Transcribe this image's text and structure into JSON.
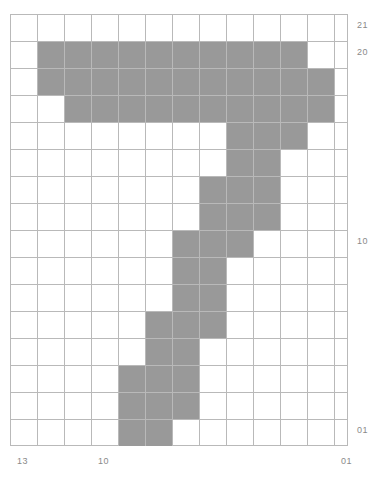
{
  "figure": {
    "kind": "grid-heatmap",
    "background_color": "#ffffff",
    "grid_line_color": "#b9b9b9",
    "filled_cell_color": "#999999"
  },
  "axes": {
    "y_ticks": [
      {
        "label": "21",
        "row_index": 0
      },
      {
        "label": "20",
        "row_index": 1
      },
      {
        "label": "10",
        "row_index": 8
      },
      {
        "label": "01",
        "row_index": 15
      }
    ],
    "x_ticks": [
      {
        "label": "13",
        "col_index": 0
      },
      {
        "label": "10",
        "col_index": 3
      },
      {
        "label": "01",
        "col_index": 12
      }
    ]
  },
  "chart_data": {
    "type": "heatmap",
    "title": "",
    "xlabel": "",
    "ylabel": "",
    "grid": true,
    "legend": "none",
    "cols": 12.52,
    "rows": 16,
    "cell_size_px": 27,
    "categories": [
      "13",
      "",
      "",
      "10",
      "",
      "",
      "",
      "",
      "",
      "",
      "",
      "",
      "01"
    ],
    "row_labels": [
      "21",
      "20",
      "",
      "",
      "",
      "",
      "",
      "",
      "10",
      "",
      "",
      "",
      "",
      "",
      "",
      "01"
    ],
    "filled_cells": [
      {
        "row": 1,
        "cols": [
          1,
          2,
          3,
          4,
          5,
          6,
          7,
          8,
          9,
          10
        ]
      },
      {
        "row": 2,
        "cols": [
          1,
          2,
          3,
          4,
          5,
          6,
          7,
          8,
          9,
          10,
          11
        ]
      },
      {
        "row": 3,
        "cols": [
          2,
          3,
          4,
          5,
          6,
          7,
          8,
          9,
          10,
          11
        ]
      },
      {
        "row": 4,
        "cols": [
          8,
          9,
          10
        ]
      },
      {
        "row": 5,
        "cols": [
          8,
          9
        ]
      },
      {
        "row": 6,
        "cols": [
          7,
          8,
          9
        ]
      },
      {
        "row": 7,
        "cols": [
          7,
          8,
          9
        ]
      },
      {
        "row": 8,
        "cols": [
          6,
          7,
          8
        ]
      },
      {
        "row": 9,
        "cols": [
          6,
          7
        ]
      },
      {
        "row": 10,
        "cols": [
          6,
          7
        ]
      },
      {
        "row": 11,
        "cols": [
          5,
          6,
          7
        ]
      },
      {
        "row": 12,
        "cols": [
          5,
          6
        ]
      },
      {
        "row": 13,
        "cols": [
          4,
          5,
          6
        ]
      },
      {
        "row": 14,
        "cols": [
          4,
          5,
          6
        ]
      },
      {
        "row": 15,
        "cols": [
          4,
          5
        ]
      }
    ]
  }
}
